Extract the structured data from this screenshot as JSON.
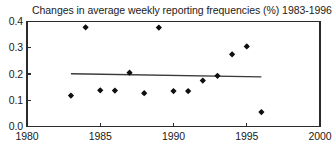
{
  "chart_data": {
    "type": "scatter",
    "title": "Changes in average weekly reporting frequencies (%) 1983-1996",
    "xlabel": "",
    "ylabel": "",
    "xlim": [
      1980,
      2000
    ],
    "ylim": [
      0.0,
      0.4
    ],
    "grid": false,
    "legend": null,
    "x_ticks": [
      1980,
      1985,
      1990,
      1995,
      2000
    ],
    "x_tick_labels": [
      "1980",
      "1985",
      "1990",
      "1995",
      "2000"
    ],
    "y_ticks": [
      0.0,
      0.1,
      0.2,
      0.3,
      0.4
    ],
    "y_tick_labels": [
      "0.0",
      "0.1",
      "0.2",
      "0.3",
      "0.4"
    ],
    "x": [
      1983,
      1984,
      1985,
      1986,
      1987,
      1988,
      1989,
      1990,
      1991,
      1992,
      1993,
      1994,
      1995,
      1996
    ],
    "values": [
      0.118,
      0.378,
      0.138,
      0.137,
      0.205,
      0.127,
      0.377,
      0.135,
      0.135,
      0.175,
      0.193,
      0.275,
      0.305,
      0.055
    ],
    "series": [
      {
        "name": "Changes in average weekly reporting frequencies",
        "marker": "diamond",
        "color": "#101010",
        "points": [
          {
            "x": 1983,
            "y": 0.118
          },
          {
            "x": 1984,
            "y": 0.378
          },
          {
            "x": 1985,
            "y": 0.138
          },
          {
            "x": 1986,
            "y": 0.137
          },
          {
            "x": 1987,
            "y": 0.205
          },
          {
            "x": 1988,
            "y": 0.127
          },
          {
            "x": 1989,
            "y": 0.377
          },
          {
            "x": 1990,
            "y": 0.135
          },
          {
            "x": 1991,
            "y": 0.135
          },
          {
            "x": 1992,
            "y": 0.175
          },
          {
            "x": 1993,
            "y": 0.193
          },
          {
            "x": 1994,
            "y": 0.275
          },
          {
            "x": 1995,
            "y": 0.305
          },
          {
            "x": 1996,
            "y": 0.055
          }
        ]
      }
    ],
    "trend_line": {
      "name": "fitted trend",
      "color": "#3a3a3a",
      "x_start": 1983,
      "y_start": 0.201,
      "x_end": 1996,
      "y_end": 0.189
    }
  }
}
